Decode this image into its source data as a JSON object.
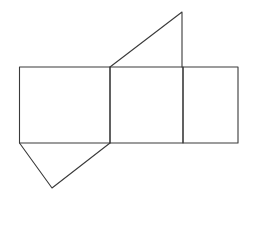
{
  "diagram": {
    "type": "net-of-triangular-prism",
    "stroke_color": "#3a3a3a",
    "background": "#ffffff",
    "rectangles": [
      {
        "name": "left-face",
        "x": 19.5,
        "y": 67,
        "w": 90.5,
        "h": 76
      },
      {
        "name": "middle-face",
        "x": 110,
        "y": 67,
        "w": 73,
        "h": 76
      },
      {
        "name": "right-face",
        "x": 183,
        "y": 67,
        "w": 55,
        "h": 76
      }
    ],
    "triangles": [
      {
        "name": "top-triangle",
        "points": "110,67 182,12 182,67"
      },
      {
        "name": "bottom-triangle",
        "points": "19.5,143 52,188 110,143"
      }
    ]
  }
}
